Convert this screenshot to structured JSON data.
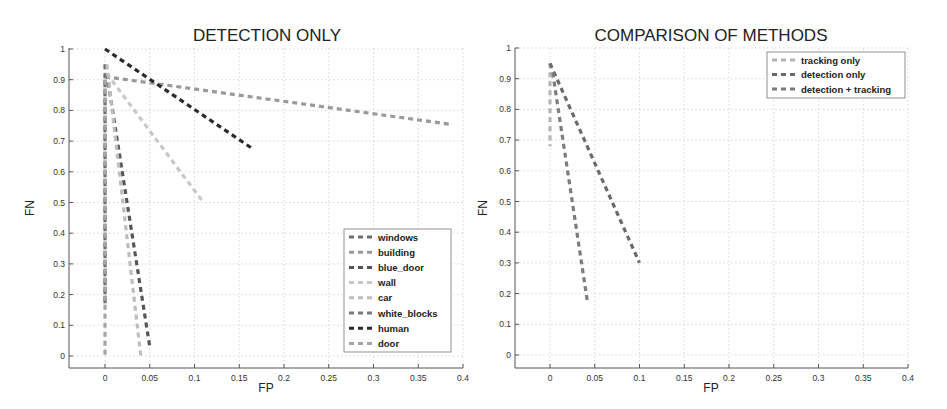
{
  "chart_data": [
    {
      "type": "line",
      "title": "DETECTION ONLY",
      "xlabel": "FP",
      "ylabel": "FN",
      "xlim": [
        -0.04,
        0.4
      ],
      "ylim": [
        -0.04,
        1
      ],
      "xticks": [
        "0",
        "0.05",
        "0.1",
        "0.15",
        "0.2",
        "0.25",
        "0.3",
        "0.35",
        "0.4"
      ],
      "yticks": [
        "0",
        "0.1",
        "0.2",
        "0.3",
        "0.4",
        "0.5",
        "0.6",
        "0.7",
        "0.8",
        "0.9",
        "1"
      ],
      "grid": true,
      "legend_position": "lower right",
      "series": [
        {
          "name": "windows",
          "color": "#6e6e6e",
          "x": [
            0,
            0
          ],
          "y": [
            0.95,
            0.17
          ]
        },
        {
          "name": "building",
          "color": "#9a9a9a",
          "x": [
            0,
            0.385
          ],
          "y": [
            0.91,
            0.755
          ]
        },
        {
          "name": "blue_door",
          "color": "#555555",
          "x": [
            0.002,
            0.05
          ],
          "y": [
            0.92,
            0.03
          ]
        },
        {
          "name": "wall",
          "color": "#c8c8c8",
          "x": [
            0.002,
            0.11
          ],
          "y": [
            0.92,
            0.5
          ]
        },
        {
          "name": "car",
          "color": "#bdbdbd",
          "x": [
            0.002,
            0.04
          ],
          "y": [
            0.95,
            0.0
          ]
        },
        {
          "name": "white_blocks",
          "color": "#7a7a7a",
          "x": [
            0,
            0
          ],
          "y": [
            0.9,
            0.17
          ]
        },
        {
          "name": "human",
          "color": "#2a2a2a",
          "x": [
            0,
            0.165
          ],
          "y": [
            1.0,
            0.675
          ]
        },
        {
          "name": "door",
          "color": "#a5a5a5",
          "x": [
            0,
            0
          ],
          "y": [
            0.9,
            0.0
          ]
        }
      ]
    },
    {
      "type": "line",
      "title": "COMPARISON OF METHODS",
      "xlabel": "FP",
      "ylabel": "FN",
      "xlim": [
        -0.04,
        0.4
      ],
      "ylim": [
        -0.04,
        1
      ],
      "xticks": [
        "0",
        "0.05",
        "0.1",
        "0.15",
        "0.2",
        "0.25",
        "0.3",
        "0.35",
        "0.4"
      ],
      "yticks": [
        "0",
        "0.1",
        "0.2",
        "0.3",
        "0.4",
        "0.5",
        "0.6",
        "0.7",
        "0.8",
        "0.9",
        "1"
      ],
      "grid": true,
      "legend_position": "upper right",
      "series": [
        {
          "name": "tracking only",
          "color": "#b5b5b5",
          "x": [
            0,
            0
          ],
          "y": [
            0.95,
            0.68
          ]
        },
        {
          "name": "detection only",
          "color": "#6a6a6a",
          "x": [
            0,
            0.1
          ],
          "y": [
            0.95,
            0.3
          ]
        },
        {
          "name": "detection + tracking",
          "color": "#7c7c7c",
          "x": [
            0.003,
            0.042
          ],
          "y": [
            0.92,
            0.17
          ]
        }
      ]
    }
  ]
}
